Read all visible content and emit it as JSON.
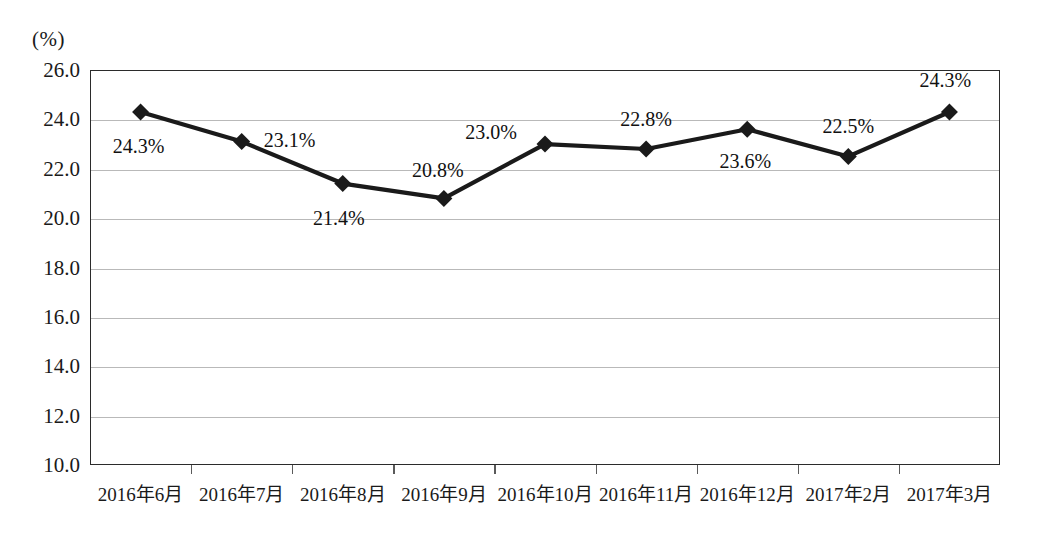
{
  "chart_data": {
    "type": "line",
    "title": "",
    "xlabel": "",
    "ylabel": "(%)",
    "unit_label": "(%)",
    "ylim": [
      10.0,
      26.0
    ],
    "ystep": 2.0,
    "grid": true,
    "legend": "none",
    "marker": "diamond",
    "line_color": "#1a1a1a",
    "marker_color": "#1a1a1a",
    "grid_color": "#b9b9b9",
    "categories": [
      "2016年6月",
      "2016年7月",
      "2016年8月",
      "2016年9月",
      "2016年10月",
      "2016年11月",
      "2016年12月",
      "2017年2月",
      "2017年3月"
    ],
    "values": [
      24.3,
      23.1,
      21.4,
      20.8,
      23.0,
      22.8,
      23.6,
      22.5,
      24.3
    ],
    "point_labels": [
      "24.3%",
      "23.1%",
      "21.4%",
      "20.8%",
      "23.0%",
      "22.8%",
      "23.6%",
      "22.5%",
      "24.3%"
    ],
    "ytick_labels": [
      "26.0",
      "24.0",
      "22.0",
      "20.0",
      "18.0",
      "16.0",
      "14.0",
      "12.0",
      "10.0"
    ],
    "ytick_values": [
      26.0,
      24.0,
      22.0,
      20.0,
      18.0,
      16.0,
      14.0,
      12.0,
      10.0
    ]
  }
}
